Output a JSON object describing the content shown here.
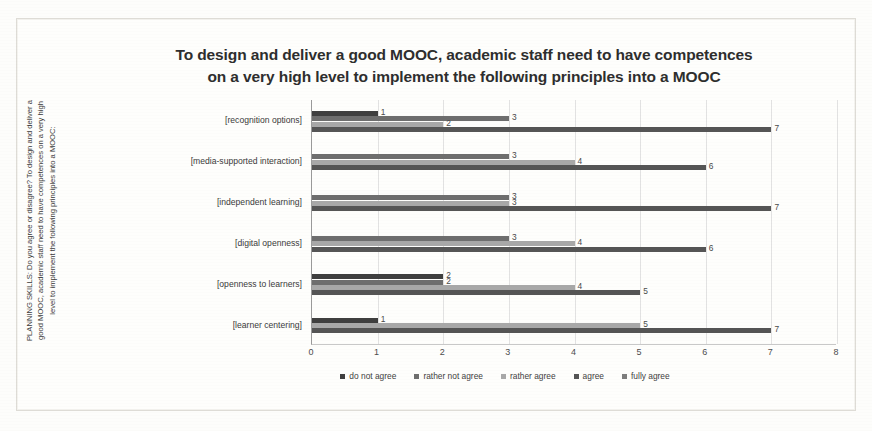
{
  "chart_data": {
    "type": "bar",
    "orientation": "horizontal",
    "title": "To design and deliver a good MOOC, academic staff need to have competences on a very high level to implement the following principles into a MOOC",
    "title_lines": [
      "To design and deliver a good MOOC, academic staff need to have competences",
      "on a very high level to implement the following principles into a MOOC"
    ],
    "ylabel": "PLANNING SKILLS: Do you agree or disagree? To design and deliver a good MOOC, academic staff need to have competences on a very high level to implement the following principles into a MOOC:",
    "xlabel": "",
    "xlim": [
      0,
      8
    ],
    "xticks": [
      "0",
      "1",
      "2",
      "3",
      "4",
      "5",
      "6",
      "7",
      "8"
    ],
    "grid": true,
    "legend_position": "bottom",
    "categories": [
      "[recognition options]",
      "[media-supported interaction]",
      "[independent learning]",
      "[digital openness]",
      "[openness to learners]",
      "[learner centering]"
    ],
    "series": [
      {
        "name": "do not agree",
        "color": "#3f3f3f",
        "values": [
          1,
          null,
          null,
          null,
          2,
          1
        ],
        "labels": [
          "1",
          "",
          "",
          "",
          "2",
          "1"
        ]
      },
      {
        "name": "rather not agree",
        "color": "#6e6e6e",
        "values": [
          3,
          3,
          3,
          3,
          2,
          null
        ],
        "labels": [
          "3",
          "3",
          "3",
          "3",
          "2",
          ""
        ]
      },
      {
        "name": "rather agree",
        "color": "#a8a8a8",
        "values": [
          2,
          4,
          3,
          4,
          4,
          5
        ],
        "labels": [
          "2",
          "4",
          "3",
          "4",
          "4",
          "5"
        ]
      },
      {
        "name": "agree",
        "color": "#555555",
        "values": [
          7,
          6,
          7,
          6,
          5,
          7
        ],
        "labels": [
          "7",
          "6",
          "7",
          "6",
          "5",
          "7"
        ]
      },
      {
        "name": "fully agree",
        "color": "#7d7d7d",
        "values": [
          null,
          null,
          null,
          null,
          null,
          null
        ],
        "labels": [
          "",
          "",
          "",
          "",
          "",
          ""
        ]
      }
    ]
  }
}
